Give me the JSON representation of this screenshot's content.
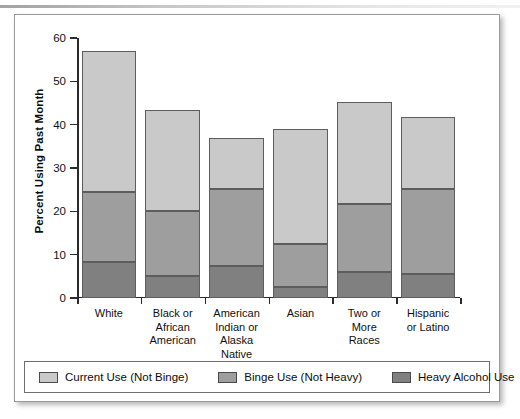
{
  "figure": {
    "ylabel": "Percent Using Past Month"
  },
  "chart_data": {
    "type": "bar",
    "stacked": true,
    "title": "",
    "xlabel": "",
    "ylabel": "Percent Using Past Month",
    "ylim": [
      0,
      60
    ],
    "yticks": [
      0,
      10,
      20,
      30,
      40,
      50,
      60
    ],
    "ytick_labels": [
      "0",
      "10",
      "20",
      "30",
      "40",
      "50",
      "60"
    ],
    "grid": false,
    "legend_position": "bottom",
    "categories": [
      "White",
      "Black or African American",
      "American Indian or Alaska Native",
      "Asian",
      "Two or More Races",
      "Hispanic or Latino"
    ],
    "category_label_lines": [
      [
        "White"
      ],
      [
        "Black or",
        "African",
        "American"
      ],
      [
        "American",
        "Indian or",
        "Alaska",
        "Native"
      ],
      [
        "Asian"
      ],
      [
        "Two or",
        "More",
        "Races"
      ],
      [
        "Hispanic",
        "or Latino"
      ]
    ],
    "series": [
      {
        "name": "Heavy Alcohol Use",
        "color": "#808080",
        "values": [
          8.3,
          5.0,
          7.4,
          2.6,
          5.9,
          5.5
        ]
      },
      {
        "name": "Binge Use (Not Heavy)",
        "color": "#9e9e9e",
        "values": [
          16.2,
          15.1,
          17.7,
          9.9,
          15.7,
          19.6
        ]
      },
      {
        "name": "Current Use (Not Binge)",
        "color": "#c9c9c9",
        "values": [
          32.5,
          23.2,
          11.8,
          26.4,
          23.6,
          16.7
        ]
      }
    ],
    "totals": [
      57.0,
      43.3,
      36.9,
      38.9,
      45.2,
      41.8
    ],
    "cumulative_boundaries": [
      [
        8.3,
        24.5,
        57.0
      ],
      [
        5.0,
        20.1,
        43.3
      ],
      [
        7.4,
        25.1,
        36.9
      ],
      [
        2.6,
        12.5,
        38.9
      ],
      [
        5.9,
        21.6,
        45.2
      ],
      [
        5.5,
        25.1,
        41.8
      ]
    ]
  },
  "legend": {
    "items": [
      {
        "label": "Current Use (Not Binge)",
        "color": "#c9c9c9"
      },
      {
        "label": "Binge Use (Not Heavy)",
        "color": "#9e9e9e"
      },
      {
        "label": "Heavy Alcohol Use",
        "color": "#808080"
      }
    ]
  }
}
